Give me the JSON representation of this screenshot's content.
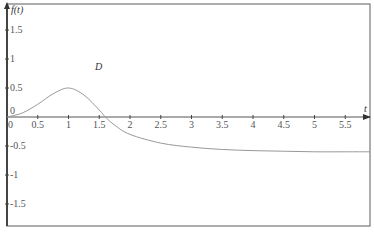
{
  "chart_data": {
    "type": "line",
    "title": "",
    "xlabel": "t",
    "ylabel": "f(t)",
    "annotation": "D",
    "xlim": [
      0,
      5.9
    ],
    "ylim": [
      -2,
      1.9
    ],
    "grid": false,
    "x_ticks": [
      "0",
      "0.5",
      "1",
      "1.5",
      "2",
      "2.5",
      "3",
      "3.5",
      "4",
      "4.5",
      "5",
      "5.5"
    ],
    "y_ticks": [
      "1.5",
      "1",
      "0.5",
      "0",
      "-0.5",
      "-1",
      "-1.5"
    ],
    "series": [
      {
        "name": "f(t)",
        "color": "#999999",
        "x": [
          0,
          0.25,
          0.5,
          0.75,
          1.0,
          1.25,
          1.5,
          1.6,
          1.75,
          2.0,
          2.5,
          3.0,
          3.5,
          4.0,
          4.5,
          5.0,
          5.5,
          5.9
        ],
        "values": [
          0,
          0.07,
          0.22,
          0.4,
          0.5,
          0.38,
          0.12,
          0.0,
          -0.14,
          -0.3,
          -0.45,
          -0.52,
          -0.56,
          -0.58,
          -0.59,
          -0.6,
          -0.6,
          -0.6
        ]
      }
    ]
  },
  "labels": {
    "y_axis_title": "f(t)",
    "x_axis_title": "t",
    "annotation": "D"
  }
}
